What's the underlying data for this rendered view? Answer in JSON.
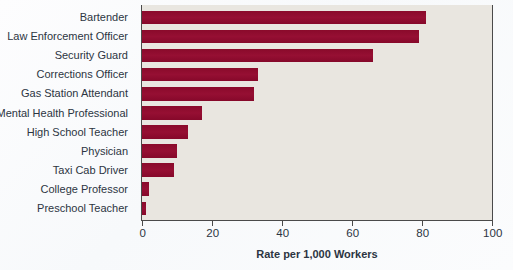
{
  "chart_data": {
    "type": "bar",
    "orientation": "horizontal",
    "title": "",
    "xlabel": "Rate per 1,000 Workers",
    "ylabel": "",
    "xlim": [
      0,
      100
    ],
    "xticks": [
      0,
      20,
      40,
      60,
      80,
      100
    ],
    "xtick_labels": [
      "0",
      "20",
      "40",
      "60",
      "80",
      "100"
    ],
    "grid": false,
    "legend": null,
    "bar_color": "#8d0b2c",
    "plot_background": "#e9e6e0",
    "categories": [
      "Bartender",
      "Law Enforcement Officer",
      "Security Guard",
      "Corrections Officer",
      "Gas Station Attendant",
      "Mental Health Professional",
      "High School Teacher",
      "Physician",
      "Taxi Cab Driver",
      "College Professor",
      "Preschool Teacher"
    ],
    "values": [
      81,
      79,
      66,
      33,
      32,
      17,
      13,
      10,
      9,
      2,
      1
    ]
  }
}
